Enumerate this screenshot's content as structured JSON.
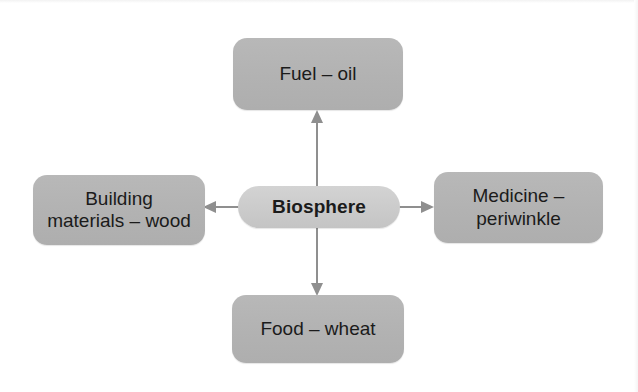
{
  "diagram": {
    "type": "hub-and-spoke",
    "title_text_present": false,
    "background_color": "#ffffff",
    "hub": {
      "label": "Biosphere",
      "fill_color": "#cccccc",
      "text_color": "#1b1b1b",
      "bold": true,
      "x": 238,
      "y": 186,
      "w": 162,
      "h": 42
    },
    "leaves": [
      {
        "id": "fuel",
        "label": "Fuel – oil",
        "direction": "up",
        "fill_color": "#b3b3b3",
        "text_color": "#1b1b1b",
        "x": 233,
        "y": 38,
        "w": 170,
        "h": 72
      },
      {
        "id": "building-materials",
        "label": "Building\nmaterials – wood",
        "direction": "left",
        "fill_color": "#b3b3b3",
        "text_color": "#1b1b1b",
        "x": 33,
        "y": 175,
        "w": 172,
        "h": 70
      },
      {
        "id": "medicine",
        "label": "Medicine –\nperiwinkle",
        "direction": "right",
        "fill_color": "#b3b3b3",
        "text_color": "#1b1b1b",
        "x": 434,
        "y": 172,
        "w": 169,
        "h": 71
      },
      {
        "id": "food",
        "label": "Food – wheat",
        "direction": "down",
        "fill_color": "#b3b3b3",
        "text_color": "#1b1b1b",
        "x": 232,
        "y": 295,
        "w": 172,
        "h": 68
      }
    ],
    "connectors": [
      {
        "id": "hub-to-fuel",
        "from": "Biosphere",
        "to": "Fuel – oil",
        "direction": "up",
        "color": "#8f8f8f"
      },
      {
        "id": "hub-to-building-materials",
        "from": "Biosphere",
        "to": "Building materials – wood",
        "direction": "left",
        "color": "#8f8f8f"
      },
      {
        "id": "hub-to-medicine",
        "from": "Biosphere",
        "to": "Medicine – periwinkle",
        "direction": "right",
        "color": "#8f8f8f"
      },
      {
        "id": "hub-to-food",
        "from": "Biosphere",
        "to": "Food – wheat",
        "direction": "down",
        "color": "#8f8f8f"
      }
    ]
  }
}
